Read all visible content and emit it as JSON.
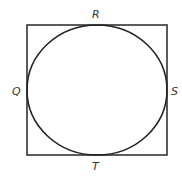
{
  "diagram": {
    "shapes": {
      "square": {
        "x": 27,
        "y": 25,
        "width": 140,
        "height": 130,
        "stroke": "#333333"
      },
      "circle": {
        "cx": 97,
        "cy": 90,
        "rx": 70,
        "ry": 65,
        "stroke": "#222222"
      }
    },
    "labels": {
      "top": "R",
      "left": "Q",
      "right": "S",
      "bottom": "T"
    }
  }
}
